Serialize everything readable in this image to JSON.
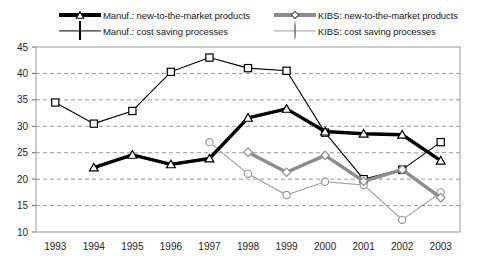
{
  "legend": {
    "items": [
      {
        "id": "manuf-new",
        "label": "Manuf.: new-to-the-market products",
        "key": "thick-black",
        "marker": "triangle"
      },
      {
        "id": "kibs-new",
        "label": "KIBS: new-to-the-market products",
        "key": "thick-gray",
        "marker": "diamond"
      },
      {
        "id": "manuf-cost",
        "label": "Manuf.: cost saving processes",
        "key": "thin-black",
        "marker": "square"
      },
      {
        "id": "kibs-cost",
        "label": "KIBS: cost saving processes",
        "key": "thin-gray",
        "marker": "circle"
      }
    ]
  },
  "chart_data": {
    "type": "line",
    "title": "",
    "xlabel": "",
    "ylabel": "",
    "categories": [
      "1993",
      "1994",
      "1995",
      "1996",
      "1997",
      "1998",
      "1999",
      "2000",
      "2001",
      "2002",
      "2003"
    ],
    "ylim": [
      10,
      45
    ],
    "yticks": [
      10,
      15,
      20,
      25,
      30,
      35,
      40,
      45
    ],
    "grid": true,
    "legend_position": "top",
    "series": [
      {
        "name": "Manuf.: new-to-the-market products",
        "color": "#000000",
        "marker": "triangle",
        "width": "thick",
        "x": [
          "1994",
          "1995",
          "1996",
          "1997",
          "1998",
          "1999",
          "2000",
          "2001",
          "2002",
          "2003"
        ],
        "values": [
          22.2,
          24.6,
          22.8,
          23.9,
          31.6,
          33.3,
          29.0,
          28.6,
          28.4,
          23.5
        ]
      },
      {
        "name": "Manuf.: cost saving processes",
        "color": "#000000",
        "marker": "square",
        "width": "thin",
        "x": [
          "1993",
          "1994",
          "1995",
          "1996",
          "1997",
          "1998",
          "1999",
          "2000",
          "2001",
          "2002",
          "2003"
        ],
        "values": [
          34.5,
          30.5,
          32.9,
          40.3,
          43.0,
          41.0,
          40.5,
          28.8,
          20.0,
          21.8,
          27.0
        ]
      },
      {
        "name": "KIBS: new-to-the-market products",
        "color": "#8c8c8c",
        "marker": "diamond",
        "width": "thick",
        "x": [
          "1998",
          "1999",
          "2000",
          "2001",
          "2002",
          "2003"
        ],
        "values": [
          25.1,
          21.3,
          24.5,
          19.6,
          21.8,
          16.5
        ]
      },
      {
        "name": "KIBS: cost saving processes",
        "color": "#9a9a9a",
        "marker": "circle",
        "width": "thin",
        "x": [
          "1997",
          "1998",
          "1999",
          "2000",
          "2001",
          "2002",
          "2003"
        ],
        "values": [
          27.0,
          21.0,
          17.0,
          19.5,
          18.9,
          12.3,
          17.5
        ]
      }
    ]
  }
}
